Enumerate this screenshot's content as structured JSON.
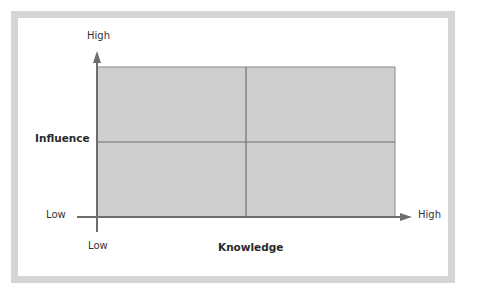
{
  "diagram": {
    "type": "quadrant-matrix",
    "y_axis": {
      "label": "Influence",
      "high_label": "High",
      "low_label": "Low"
    },
    "x_axis": {
      "label": "Knowledge",
      "high_label": "High",
      "low_label": "Low"
    },
    "quadrants": [
      {
        "position": "top-left",
        "text": ""
      },
      {
        "position": "top-right",
        "text": ""
      },
      {
        "position": "bottom-left",
        "text": ""
      },
      {
        "position": "bottom-right",
        "text": ""
      }
    ],
    "colors": {
      "quadrant_fill": "#cfcfcf",
      "axis": "#6e6e6e",
      "grid_line": "#7a7a7a",
      "frame": "#d5d5d5"
    }
  }
}
